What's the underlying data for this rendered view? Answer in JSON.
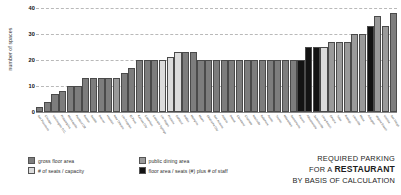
{
  "caption": {
    "line1": "REQUIRED PARKING",
    "line2_prefix": "FOR A ",
    "line2_strong": "RESTAURANT",
    "line3": "BY BASIS OF CALCULATION"
  },
  "legend": {
    "items": [
      {
        "label": "gross floor area",
        "pattern": "p-gross",
        "color": "#7d7d7d"
      },
      {
        "label": "public dining area",
        "pattern": "p-dining",
        "color": "#9a9a9a"
      },
      {
        "label": "# of seats / capacity",
        "pattern": "p-seats",
        "color": "#dcdcdc"
      },
      {
        "label": "floor area / seats (#) plus # of staff",
        "pattern": "p-staff",
        "color": "#131313"
      }
    ]
  },
  "chart_data": {
    "type": "bar",
    "title": "REQUIRED PARKING FOR A RESTAURANT BY BASIS OF CALCULATION",
    "xlabel": "",
    "ylabel": "number of spaces",
    "ylim": [
      0,
      40
    ],
    "yticks": [
      0,
      10,
      20,
      30,
      40
    ],
    "grid": true,
    "legend_position": "bottom-left",
    "categories": [
      "San Francisco",
      "Chicago",
      "Washington D.C.",
      "Philadelphia",
      "Minneapolis",
      "Portland OR",
      "Boston",
      "Seattle",
      "Denver",
      "Houston",
      "New Orleans",
      "Los Angeles",
      "El Paso",
      "Kansas City",
      "Columbus",
      "Colorado Springs",
      "Las Vegas",
      "Phoenix",
      "Oakland",
      "Dallas",
      "Memphis",
      "Miami",
      "Oklahoma City",
      "San Antonio",
      "Atlanta",
      "Detroit",
      "Cleveland",
      "Charlotte",
      "Nashville",
      "Baltimore",
      "Austin",
      "Tucson",
      "Milwaukee",
      "Sacramento",
      "Fresno",
      "Albuquerque",
      "Jacksonville",
      "Long Beach",
      "Omaha",
      "Tulsa",
      "Raleigh",
      "Louisville",
      "Mesa",
      "Arlington",
      "Virginia Beach",
      "Wichita",
      "San Diego"
    ],
    "values": [
      2,
      4,
      7,
      8,
      10,
      10,
      13,
      13,
      13,
      13,
      13,
      15,
      17,
      20,
      20,
      20,
      20,
      21,
      23,
      23,
      23,
      20,
      20,
      20,
      20,
      20,
      20,
      20,
      20,
      20,
      20,
      20,
      20,
      20,
      20,
      25,
      25,
      25,
      27,
      27,
      27,
      30,
      30,
      33,
      37,
      33,
      38
    ],
    "patterns": [
      "p-gross",
      "p-gross",
      "p-gross",
      "p-gross",
      "p-gross",
      "p-gross",
      "p-gross",
      "p-gross",
      "p-gross",
      "p-gross",
      "p-dining",
      "p-gross",
      "p-gross",
      "p-gross",
      "p-gross",
      "p-gross",
      "p-seats",
      "p-seats",
      "p-seats",
      "p-gross",
      "p-gross",
      "p-gross",
      "p-gross",
      "p-gross",
      "p-gross",
      "p-gross",
      "p-gross",
      "p-gross",
      "p-gross",
      "p-gross",
      "p-gross",
      "p-gross",
      "p-gross",
      "p-gross",
      "p-staff",
      "p-staff",
      "p-staff",
      "p-seats",
      "p-dining",
      "p-dining",
      "p-dining",
      "p-dining",
      "p-dining",
      "p-staff",
      "p-dining",
      "p-dining",
      "p-gross"
    ]
  }
}
